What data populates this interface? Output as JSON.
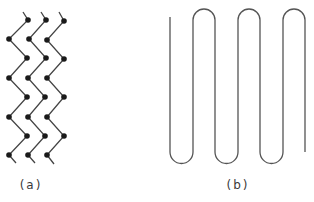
{
  "figure": {
    "panels": [
      {
        "id": "a",
        "label": "(a)",
        "description": "Three parallel zigzag chains with dot vertices",
        "chains": 3,
        "vertices_per_chain": 8,
        "dot_color": "#1a1a1a",
        "line_color": "#444444"
      },
      {
        "id": "b",
        "label": "(b)",
        "description": "Single continuous serpentine (meander) line with 3 top and 3 bottom turns",
        "top_turns": 3,
        "bottom_turns": 3,
        "line_color": "#555555"
      }
    ]
  }
}
